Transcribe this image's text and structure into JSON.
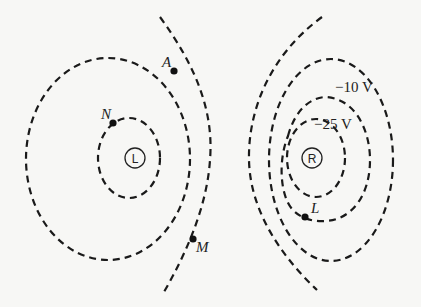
{
  "diagram": {
    "type": "equipotential-lines",
    "charges": [
      {
        "id": "left",
        "label": "L",
        "x": 135,
        "y": 158
      },
      {
        "id": "right",
        "label": "R",
        "x": 312,
        "y": 158
      }
    ],
    "potential_labels": [
      {
        "text": "−10 V",
        "x": 342,
        "y": 90
      },
      {
        "text": "−25 V",
        "x": 314,
        "y": 131
      }
    ],
    "points": [
      {
        "label": "A",
        "x": 174,
        "y": 71,
        "label_x": 162,
        "label_y": 67
      },
      {
        "label": "N",
        "x": 113,
        "y": 123,
        "label_x": 101,
        "label_y": 119
      },
      {
        "label": "M",
        "x": 193,
        "y": 239,
        "label_x": 196,
        "label_y": 252
      },
      {
        "label": "L",
        "x": 305,
        "y": 217,
        "label_x": 311,
        "label_y": 213
      }
    ],
    "line_style": "dashed",
    "colors": {
      "line": "#1a1a1a",
      "background": "#f7f7f5"
    }
  }
}
